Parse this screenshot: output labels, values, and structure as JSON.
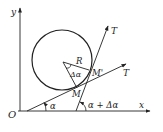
{
  "diagram": {
    "type": "geometry",
    "labels": {
      "y_axis": "y",
      "x_axis": "x",
      "origin": "O",
      "tangent_1": "T",
      "tangent_2": "T",
      "radius": "R",
      "center_angle": "Δα",
      "point_m": "M",
      "point_m_prime": "M'",
      "angle_alpha": "α",
      "angle_alpha_plus": "α + Δα"
    },
    "colors": {
      "stroke": "#222222",
      "background": "#ffffff"
    }
  }
}
